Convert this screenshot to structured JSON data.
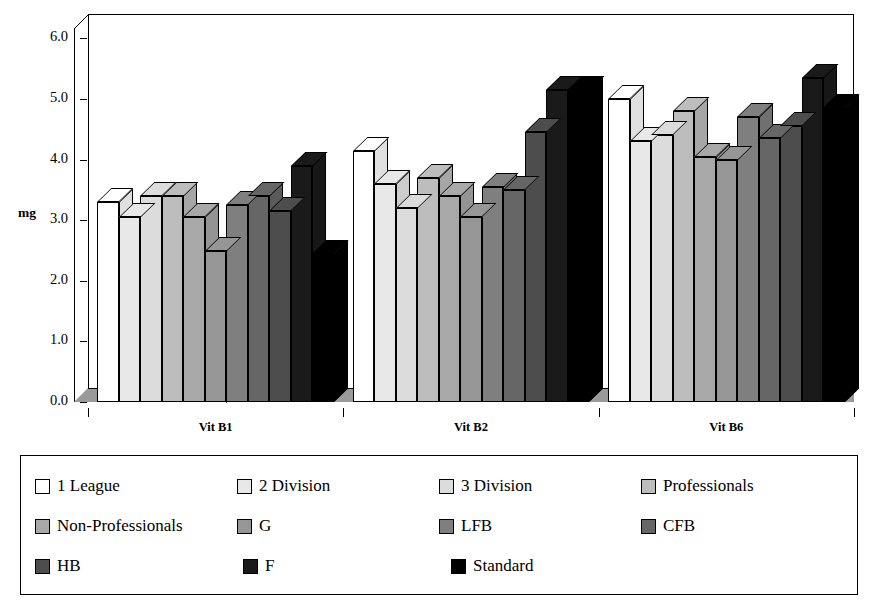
{
  "chart_data": {
    "type": "bar",
    "title": "",
    "xlabel": "",
    "ylabel": "mg",
    "ylim": [
      0.0,
      6.0
    ],
    "ytick_labels": [
      "0.0",
      "1.0",
      "2.0",
      "3.0",
      "4.0",
      "5.0",
      "6.0"
    ],
    "ytick_values": [
      0.0,
      1.0,
      2.0,
      3.0,
      4.0,
      5.0,
      6.0
    ],
    "grid": false,
    "legend_position": "bottom",
    "style": "3d-clustered-column-grayscale",
    "categories": [
      "Vit B1",
      "Vit B2",
      "Vit B6"
    ],
    "series": [
      {
        "name": "1 League",
        "color": "#ffffff",
        "values": [
          3.3,
          4.15,
          5.0
        ]
      },
      {
        "name": "2 Division",
        "color": "#e8e8e8",
        "values": [
          3.05,
          3.6,
          4.3
        ]
      },
      {
        "name": "3 Division",
        "color": "#dcdcdc",
        "values": [
          3.4,
          3.2,
          4.4
        ]
      },
      {
        "name": "Professionals",
        "color": "#bdbdbd",
        "values": [
          3.4,
          3.7,
          4.8
        ]
      },
      {
        "name": "Non-Professionals",
        "color": "#a8a8a8",
        "values": [
          3.05,
          3.4,
          4.05
        ]
      },
      {
        "name": "G",
        "color": "#969696",
        "values": [
          2.5,
          3.05,
          4.0
        ]
      },
      {
        "name": "LFB",
        "color": "#7f7f7f",
        "values": [
          3.25,
          3.55,
          4.7
        ]
      },
      {
        "name": "CFB",
        "color": "#666666",
        "values": [
          3.4,
          3.5,
          4.35
        ]
      },
      {
        "name": "HB",
        "color": "#4d4d4d",
        "values": [
          3.15,
          4.45,
          4.55
        ]
      },
      {
        "name": "F",
        "color": "#1a1a1a",
        "values": [
          3.9,
          5.15,
          5.35
        ]
      },
      {
        "name": "Standard",
        "color": "#000000",
        "values": [
          2.45,
          5.15,
          4.85
        ]
      }
    ]
  },
  "axis": {
    "y_title": "mg"
  },
  "legend": {
    "items": [
      {
        "label": "1 League",
        "color": "#ffffff"
      },
      {
        "label": "2 Division",
        "color": "#e8e8e8"
      },
      {
        "label": "3 Division",
        "color": "#dcdcdc"
      },
      {
        "label": "Professionals",
        "color": "#bdbdbd"
      },
      {
        "label": "Non-Professionals",
        "color": "#a8a8a8"
      },
      {
        "label": "G",
        "color": "#969696"
      },
      {
        "label": "LFB",
        "color": "#7f7f7f"
      },
      {
        "label": "CFB",
        "color": "#666666"
      },
      {
        "label": "HB",
        "color": "#4d4d4d"
      },
      {
        "label": "F",
        "color": "#1a1a1a"
      },
      {
        "label": "Standard",
        "color": "#000000"
      }
    ]
  }
}
